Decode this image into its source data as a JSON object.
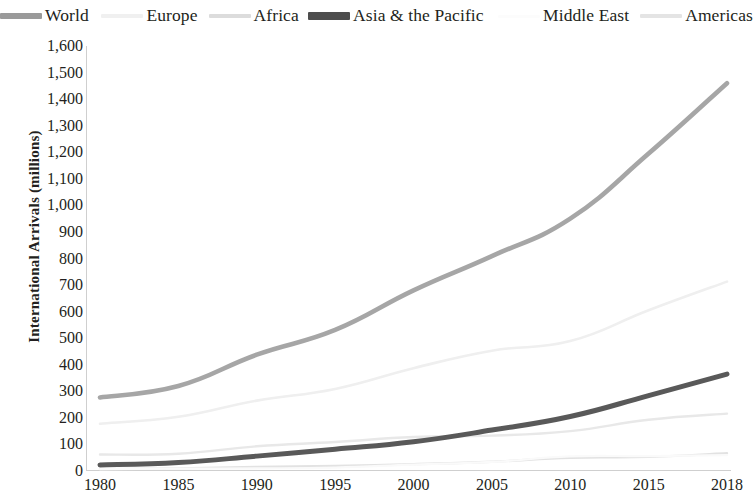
{
  "chart_data": {
    "type": "line",
    "title": "",
    "xlabel": "",
    "ylabel": "International Arrivals (millions)",
    "x": [
      1980,
      1985,
      1990,
      1995,
      2000,
      2005,
      2010,
      2015,
      2018
    ],
    "xticklabels": [
      "1980",
      "1985",
      "1990",
      "1995",
      "2000",
      "2005",
      "2010",
      "2015",
      "2018"
    ],
    "yticklabels": [
      "1,600",
      "1,500",
      "1,400",
      "1,300",
      "1,200",
      "1,100",
      "1,000",
      "900",
      "800",
      "700",
      "600",
      "500",
      "400",
      "300",
      "200",
      "100",
      "0"
    ],
    "yticks": [
      1600,
      1500,
      1400,
      1300,
      1200,
      1100,
      1000,
      900,
      800,
      700,
      600,
      500,
      400,
      300,
      200,
      100,
      0
    ],
    "ylim": [
      0,
      1600
    ],
    "xlim": [
      1980,
      2018
    ],
    "grid": false,
    "legend_position": "top",
    "series": [
      {
        "name": "World",
        "color": "#a6a6a6",
        "width": 4.6,
        "values": [
          277,
          320,
          438,
          531,
          680,
          809,
          950,
          1195,
          1460
        ]
      },
      {
        "name": "Europe",
        "color": "#efefef",
        "width": 2.6,
        "values": [
          178,
          204,
          265,
          309,
          387,
          453,
          489,
          605,
          713
        ]
      },
      {
        "name": "Africa",
        "color": "#e2e2e2",
        "width": 2.4,
        "values": [
          7,
          10,
          15,
          19,
          26,
          35,
          50,
          53,
          67
        ]
      },
      {
        "name": "Asia & the Pacific",
        "color": "#595959",
        "width": 5.0,
        "values": [
          23,
          32,
          56,
          82,
          110,
          154,
          205,
          284,
          365
        ]
      },
      {
        "name": "Middle East",
        "color": "#fafafa",
        "width": 2.2,
        "values": [
          7,
          9,
          10,
          13,
          24,
          34,
          55,
          56,
          60
        ]
      },
      {
        "name": "Americas",
        "color": "#e8e8e8",
        "width": 2.4,
        "values": [
          62,
          65,
          93,
          109,
          128,
          133,
          150,
          193,
          216
        ]
      }
    ]
  },
  "legend": {
    "items": [
      {
        "label": "World",
        "color": "#9a9a9a",
        "swatch_height": 6,
        "gap_after": 30
      },
      {
        "label": "Europe",
        "color": "#f0f0f0",
        "swatch_height": 4,
        "gap_after": 26
      },
      {
        "label": "Africa",
        "color": "#dcdcdc",
        "swatch_height": 4,
        "gap_after": 22
      },
      {
        "label": "Asia & the Pacific",
        "color": "#4d4d4d",
        "swatch_height": 8,
        "gap_after": 34
      },
      {
        "label": "Middle East",
        "color": "#fcfcfc",
        "swatch_height": 3,
        "gap_after": 26
      },
      {
        "label": "Americas",
        "color": "#e4e4e4",
        "swatch_height": 4,
        "gap_after": 0
      }
    ]
  }
}
